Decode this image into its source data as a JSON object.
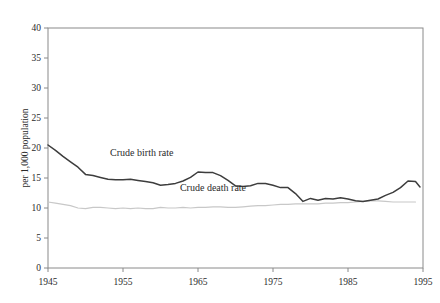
{
  "figure": {
    "background_color": "#ffffff",
    "frame_color": "#8a8a8a",
    "top_clipped_remnant": "........."
  },
  "chart_data": {
    "type": "line",
    "title": "",
    "subtitle": "",
    "xlabel": "",
    "ylabel": "per 1,000 population",
    "xlim": [
      1945,
      1995
    ],
    "ylim": [
      0,
      40
    ],
    "xticks": [
      1945,
      1955,
      1965,
      1975,
      1985,
      1995
    ],
    "xticklabels": [
      "1945",
      "1955",
      "1965",
      "1975",
      "1985",
      "1995"
    ],
    "yticks": [
      0,
      5,
      10,
      15,
      20,
      25,
      30,
      35,
      40
    ],
    "yticklabels": [
      "0",
      "5",
      "10",
      "15",
      "20",
      "25",
      "30",
      "35",
      "40"
    ],
    "grid": false,
    "legend_position": "inline-annotations",
    "annotations": [
      {
        "text": "Crude birth rate",
        "x": 1957.5,
        "y": 18.6,
        "series": "Crude birth rate"
      },
      {
        "text": "Crude death rate",
        "x": 1967.0,
        "y": 12.9,
        "series": "Crude death rate"
      }
    ],
    "series": [
      {
        "name": "Crude birth rate",
        "color": "#3d3d3d",
        "line_width": 1.5,
        "x": [
          1945,
          1946,
          1947,
          1948,
          1949,
          1950,
          1951,
          1952,
          1953,
          1954,
          1955,
          1956,
          1957,
          1958,
          1959,
          1960,
          1961,
          1962,
          1963,
          1964,
          1965,
          1966,
          1967,
          1968,
          1969,
          1970,
          1971,
          1972,
          1973,
          1974,
          1975,
          1976,
          1977,
          1978,
          1979,
          1980,
          1981,
          1982,
          1983,
          1984,
          1985,
          1986,
          1987,
          1988,
          1989,
          1990,
          1991,
          1992,
          1993,
          1994
        ],
        "values": [
          20.5,
          19.6,
          18.6,
          17.7,
          16.8,
          15.6,
          15.4,
          15.1,
          14.8,
          14.7,
          14.7,
          14.8,
          14.6,
          14.4,
          14.2,
          13.8,
          13.9,
          14.1,
          14.5,
          15.1,
          16.0,
          15.9,
          15.9,
          15.4,
          14.6,
          13.7,
          13.6,
          13.7,
          14.1,
          14.1,
          13.8,
          13.4,
          13.4,
          12.4,
          11.1,
          11.6,
          11.3,
          11.6,
          11.5,
          11.7,
          11.5,
          11.2,
          11.1,
          11.3,
          11.5,
          12.1,
          12.6,
          13.4,
          14.5,
          14.4
        ],
        "endpoint_value": 13.5
      },
      {
        "name": "Crude death rate",
        "color": "#c8c8c8",
        "line_width": 1.2,
        "x": [
          1945,
          1946,
          1947,
          1948,
          1949,
          1950,
          1951,
          1952,
          1953,
          1954,
          1955,
          1956,
          1957,
          1958,
          1959,
          1960,
          1961,
          1962,
          1963,
          1964,
          1965,
          1966,
          1967,
          1968,
          1969,
          1970,
          1971,
          1972,
          1973,
          1974,
          1975,
          1976,
          1977,
          1978,
          1979,
          1980,
          1981,
          1982,
          1983,
          1984,
          1985,
          1986,
          1987,
          1988,
          1989,
          1990,
          1991,
          1992,
          1993,
          1994
        ],
        "values": [
          11.0,
          10.8,
          10.6,
          10.4,
          10.0,
          9.9,
          10.1,
          10.1,
          10.0,
          9.9,
          10.0,
          9.9,
          10.0,
          9.9,
          9.9,
          10.1,
          10.0,
          10.0,
          10.1,
          10.0,
          10.1,
          10.1,
          10.2,
          10.2,
          10.1,
          10.1,
          10.2,
          10.3,
          10.4,
          10.4,
          10.5,
          10.6,
          10.6,
          10.7,
          10.7,
          10.7,
          10.7,
          10.8,
          10.8,
          10.9,
          10.9,
          11.0,
          11.1,
          11.2,
          11.2,
          11.1,
          11.0,
          11.0,
          11.0,
          11.0
        ]
      }
    ]
  }
}
